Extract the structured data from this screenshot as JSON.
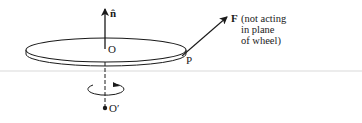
{
  "diagram": {
    "colors": {
      "stroke": "#1a1a1a",
      "background": "#ffffff",
      "separator": "#e6e6e6"
    },
    "labels": {
      "normal_vector": "n̂",
      "center": "O",
      "point_on_rim": "P",
      "force": "F",
      "force_note_line1": "(not acting",
      "force_note_line2": "in plane",
      "force_note_line3": "of wheel)",
      "axis_point": "O′"
    },
    "elements": {
      "wheel": "disk",
      "normal_arrow": "arrow-up",
      "force_arrow": "arrow-diagonal",
      "rotation_indicator": "circular-arrow",
      "axis": "dashed-line"
    }
  }
}
